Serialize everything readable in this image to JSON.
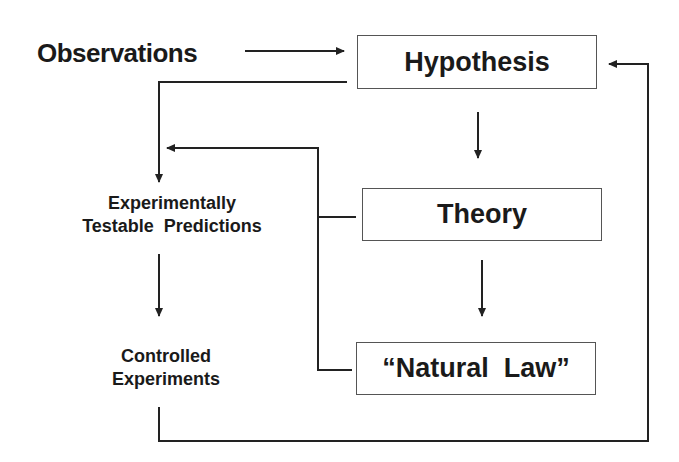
{
  "diagram": {
    "observations": "Observations",
    "hypothesis": "Hypothesis",
    "theory": "Theory",
    "natural_law": "“Natural  Law”",
    "predictions_line1": "Experimentally",
    "predictions_line2": "Testable  Predictions",
    "experiments_line1": "Controlled",
    "experiments_line2": "Experiments",
    "line_color": "#222222"
  }
}
